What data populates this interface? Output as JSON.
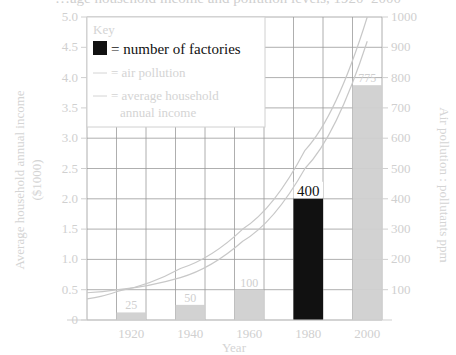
{
  "title_partial": "…age household income and pollution levels, 1920–2000",
  "chart_data": {
    "type": "bar",
    "title": "",
    "xlabel": "Year",
    "ylabel_left": "Average household annual income ($1000)",
    "ylabel_right": "Air pollution : pollutants ppm",
    "categories": [
      "1920",
      "1940",
      "1960",
      "1980",
      "2000"
    ],
    "left_axis": {
      "range": [
        0,
        5.0
      ],
      "ticks": [
        "0",
        "0.5",
        "1.0",
        "1.5",
        "2.0",
        "2.5",
        "3.0",
        "3.5",
        "4.0",
        "4.5",
        "5.0"
      ]
    },
    "right_axis": {
      "range": [
        0,
        1000
      ],
      "ticks": [
        "100",
        "200",
        "300",
        "400",
        "500",
        "600",
        "700",
        "800",
        "900",
        "1000"
      ]
    },
    "grid": true,
    "series": [
      {
        "name": "number of factories",
        "type": "bar",
        "axis": "right",
        "values": [
          25,
          50,
          100,
          400,
          775
        ],
        "labels": [
          "25",
          "50",
          "100",
          "400",
          "775"
        ],
        "colors": [
          "#d0d0d0",
          "#d0d0d0",
          "#d0d0d0",
          "#111111",
          "#d0d0d0"
        ]
      },
      {
        "name": "air pollution",
        "type": "line",
        "axis": "right",
        "x": [
          1910,
          1920,
          1940,
          1960,
          1980,
          2000
        ],
        "values": [
          70,
          95,
          170,
          300,
          560,
          1000
        ]
      },
      {
        "name": "average household annual income",
        "type": "line",
        "axis": "left",
        "x": [
          1910,
          1920,
          1940,
          1960,
          1980,
          2000
        ],
        "values": [
          0.45,
          0.5,
          0.7,
          1.3,
          2.5,
          4.6
        ]
      }
    ],
    "legend": {
      "title": "Key",
      "position": "upper-left",
      "entries": [
        {
          "symbol": "black-square",
          "label": "= number of factories"
        },
        {
          "symbol": "line",
          "label": "= air pollution"
        },
        {
          "symbol": "line",
          "label": "= average household annual income"
        }
      ]
    }
  },
  "legend": {
    "title": "Key",
    "entry1": "= number of factories",
    "entry2": "= air pollution",
    "entry3a": "= average household",
    "entry3b": "annual income"
  },
  "axes": {
    "left_label_line1": "Average household annual income",
    "left_label_line2": "($1000)",
    "right_label": "Air pollution : pollutants ppm",
    "x_label": "Year"
  }
}
